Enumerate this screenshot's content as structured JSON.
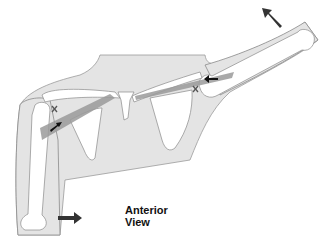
{
  "diagram": {
    "view_label_line1": "Anterior",
    "view_label_line2": "View",
    "markers": [
      {
        "type": "x-mark",
        "location": "left shoulder attachment"
      },
      {
        "type": "x-mark",
        "location": "right shoulder attachment"
      }
    ],
    "arrows": [
      {
        "location": "upper right, above raised arm",
        "direction": "up-left"
      },
      {
        "location": "right shoulder muscle",
        "direction": "left"
      },
      {
        "location": "left shoulder muscle",
        "direction": "up-right"
      },
      {
        "location": "lower left, beside lowered arm",
        "direction": "right"
      }
    ],
    "colors": {
      "skin": "#e4e4e4",
      "bone": "#ffffff",
      "outline": "#8a8a8a",
      "muscle": "#9a9a9a",
      "arrow": "#333333"
    }
  }
}
